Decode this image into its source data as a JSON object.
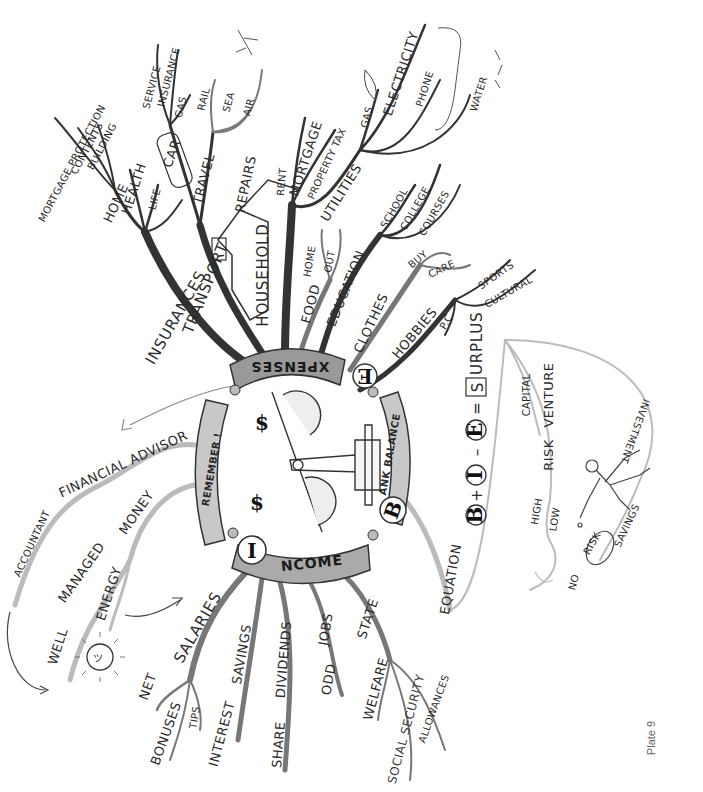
{
  "plate_label": "Plate 9",
  "center": {
    "image": "scales-with-dollar-figures",
    "hubs": {
      "expenses": {
        "initial": "E",
        "rest": "XPENSES"
      },
      "income": {
        "initial": "I",
        "rest": "NCOME"
      },
      "bank_balance": {
        "initial": "B",
        "rest": "ANK BALANCE"
      },
      "remember": {
        "label": "REMEMBER !"
      }
    }
  },
  "expenses": {
    "insurances": {
      "label": "INSURANCES",
      "children": [
        "LIFE",
        "HEALTH",
        "HOME"
      ],
      "home_children": [
        "MORTGAGE PROTECTION",
        "CONTENTS",
        "BUILDING"
      ]
    },
    "transport": {
      "label": "TRANSPORT",
      "car": {
        "label": "CAR",
        "children": [
          "SERVICE",
          "INSURANCE",
          "GAS"
        ]
      },
      "travel": {
        "label": "TRAVEL",
        "children": [
          "RAIL",
          "SEA",
          "AIR"
        ]
      }
    },
    "household": {
      "label": "HOUSEHOLD",
      "children": [
        "REPAIRS",
        "RENT",
        "MORTGAGE",
        "PROPERTY TAX"
      ],
      "utilities": {
        "label": "UTILITIES",
        "children": [
          "GAS",
          "ELECTRICITY",
          "PHONE",
          "WATER"
        ]
      }
    },
    "food": {
      "label": "FOOD",
      "children": [
        "HOME",
        "OUT"
      ]
    },
    "education": {
      "label": "EDUCATION",
      "children": [
        "SCHOOL",
        "COLLEGE",
        "COURSES"
      ]
    },
    "clothes": {
      "label": "CLOTHES",
      "children": [
        "BUY",
        "CARE"
      ]
    },
    "hobbies": {
      "label": "HOBBIES",
      "children": [
        "P.C.",
        "SPORTS",
        "CULTURAL"
      ]
    }
  },
  "income": {
    "salaries": {
      "label": "SALARIES",
      "children": [
        "NET",
        "BONUSES",
        "TIPS"
      ]
    },
    "savings": {
      "label": "SAVINGS",
      "children": [
        "INTEREST"
      ]
    },
    "dividends": {
      "label": "DIVIDENDS",
      "children": [
        "SHARE"
      ]
    },
    "jobs": {
      "label": "JOBS",
      "children": [
        "ODD"
      ]
    },
    "state": {
      "label": "STATE",
      "children": [
        "WELFARE",
        "SOCIAL SECURITY",
        "ALLOWANCES"
      ]
    }
  },
  "remember": {
    "advisor": {
      "label": "FINANCIAL ADVISOR",
      "child": "ACCOUNTANT"
    },
    "money": {
      "label": "MONEY",
      "managed": "MANAGED",
      "well": "WELL",
      "energy": "ENERGY"
    }
  },
  "bank_balance": {
    "equation_label": "EQUATION",
    "equation": {
      "b": "B",
      "plus": "+",
      "i": "I",
      "minus": "–",
      "e": "E",
      "equals": "=",
      "s": "S",
      "s_rest": "URPLUS"
    },
    "surplus": {
      "capital": "CAPITAL",
      "venture": "VENTURE",
      "risk": "RISK",
      "high": "HIGH",
      "low": "LOW",
      "no": "NO",
      "no_risk": "RISK",
      "savings": "SAVINGS",
      "investment": "INVESTMENT"
    }
  }
}
